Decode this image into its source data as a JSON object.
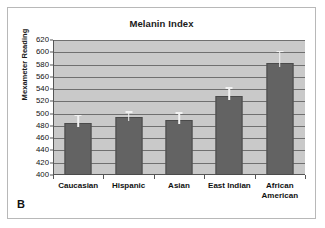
{
  "panel": {
    "letter": "B"
  },
  "chart_data": {
    "type": "bar",
    "title": "Melanin Index",
    "xlabel": "",
    "ylabel": "Mexameter Reading",
    "ylim": [
      400,
      620
    ],
    "ytick_step": 20,
    "yticks": [
      400,
      420,
      440,
      460,
      480,
      500,
      520,
      540,
      560,
      580,
      600,
      620
    ],
    "grid": true,
    "legend": "none",
    "categories": [
      "Caucasian",
      "Hispanic",
      "Asian",
      "East Indian",
      "African\nAmerican"
    ],
    "values": [
      484,
      494,
      489,
      528,
      583
    ],
    "error_upper": [
      498,
      504,
      502,
      543,
      602
    ],
    "errors": [
      14,
      10,
      13,
      15,
      19
    ],
    "colors": {
      "bar": "#636363",
      "bar_edge": "#4a4a4a",
      "plot_background": "#c9c9c9",
      "gridline": "#6f6f6f",
      "axis": "#555555",
      "error_bar": "#f2f2f2",
      "text": "#111111",
      "panel_border": "#b8b8b8",
      "figure_background": "#ffffff"
    }
  }
}
